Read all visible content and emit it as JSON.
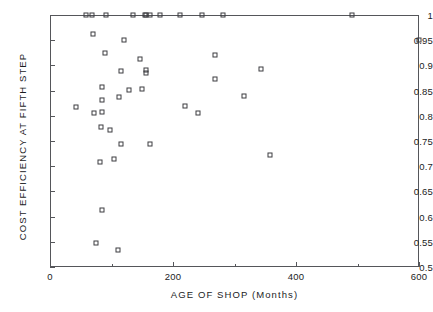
{
  "chart_data": {
    "type": "scatter",
    "title": "",
    "xlabel": "AGE OF SHOP  (Months)",
    "ylabel": "COST EFFICIENCY AT FIFTH STEP",
    "xlim": [
      0,
      600
    ],
    "ylim": [
      0.5,
      1.0
    ],
    "grid": false,
    "legend": null,
    "marker": "open-square",
    "xticks": [
      0,
      200,
      400,
      600
    ],
    "xtick_labels": [
      "0",
      "200",
      "400",
      "600"
    ],
    "x_minor_ticks": [
      100,
      300,
      500
    ],
    "yticks": [
      0.5,
      0.55,
      0.6,
      0.65,
      0.7,
      0.75,
      0.8,
      0.85,
      0.9,
      0.95,
      1
    ],
    "ytick_labels": [
      "0.5",
      "0.55",
      "0.6",
      "0.65",
      "0.7",
      "0.75",
      "0.8",
      "0.85",
      "0.9",
      "0.95",
      "1"
    ],
    "series": [
      {
        "name": "shops",
        "points": [
          {
            "x": 58,
            "y": 1.0
          },
          {
            "x": 68,
            "y": 1.0
          },
          {
            "x": 91,
            "y": 1.0
          },
          {
            "x": 135,
            "y": 1.0
          },
          {
            "x": 154,
            "y": 1.0
          },
          {
            "x": 156,
            "y": 1.0
          },
          {
            "x": 163,
            "y": 1.0
          },
          {
            "x": 179,
            "y": 1.0
          },
          {
            "x": 211,
            "y": 1.0
          },
          {
            "x": 247,
            "y": 1.0
          },
          {
            "x": 281,
            "y": 1.0
          },
          {
            "x": 491,
            "y": 1.0
          },
          {
            "x": 600,
            "y": 0.951
          },
          {
            "x": 70,
            "y": 0.963
          },
          {
            "x": 121,
            "y": 0.95
          },
          {
            "x": 90,
            "y": 0.924
          },
          {
            "x": 146,
            "y": 0.913
          },
          {
            "x": 268,
            "y": 0.921
          },
          {
            "x": 343,
            "y": 0.892
          },
          {
            "x": 116,
            "y": 0.888
          },
          {
            "x": 156,
            "y": 0.89
          },
          {
            "x": 156,
            "y": 0.884
          },
          {
            "x": 269,
            "y": 0.874
          },
          {
            "x": 85,
            "y": 0.858
          },
          {
            "x": 149,
            "y": 0.854
          },
          {
            "x": 128,
            "y": 0.852
          },
          {
            "x": 315,
            "y": 0.84
          },
          {
            "x": 113,
            "y": 0.837
          },
          {
            "x": 84,
            "y": 0.831
          },
          {
            "x": 219,
            "y": 0.82
          },
          {
            "x": 43,
            "y": 0.817
          },
          {
            "x": 72,
            "y": 0.806
          },
          {
            "x": 84,
            "y": 0.807
          },
          {
            "x": 240,
            "y": 0.805
          },
          {
            "x": 83,
            "y": 0.778
          },
          {
            "x": 98,
            "y": 0.771
          },
          {
            "x": 116,
            "y": 0.744
          },
          {
            "x": 163,
            "y": 0.744
          },
          {
            "x": 358,
            "y": 0.722
          },
          {
            "x": 104,
            "y": 0.715
          },
          {
            "x": 82,
            "y": 0.708
          },
          {
            "x": 85,
            "y": 0.614
          },
          {
            "x": 75,
            "y": 0.547
          },
          {
            "x": 110,
            "y": 0.533
          }
        ]
      }
    ]
  }
}
